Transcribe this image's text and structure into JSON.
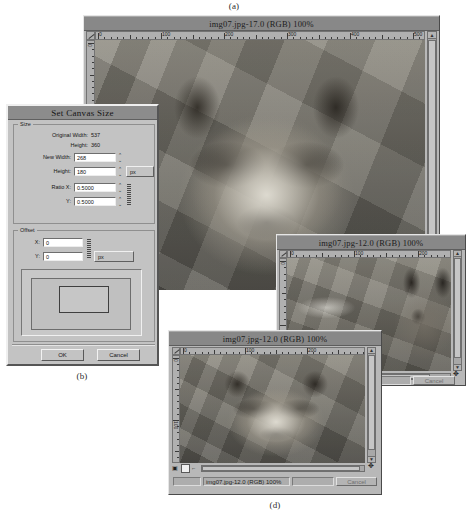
{
  "figure": {
    "captions": [
      {
        "id": "a",
        "label": "(a)"
      },
      {
        "id": "b",
        "label": "(b)"
      },
      {
        "id": "c",
        "label": "(c)"
      },
      {
        "id": "d",
        "label": "(d)"
      }
    ]
  },
  "windows": {
    "main": {
      "title": "img07.jpg-17.0 (RGB) 100%",
      "ruler_h_labels": [
        "0",
        "100",
        "200",
        "300",
        "400",
        "500"
      ],
      "ruler_v_labels": [
        "0"
      ],
      "statusbar_text": "(RGB) 100%"
    },
    "preview_c": {
      "title": "img07.jpg-12.0 (RGB) 100%",
      "ruler_h_labels": [
        "0",
        "100",
        "200"
      ],
      "ruler_v_labels": [
        "0"
      ],
      "statusbar_text": "RGB) 100%",
      "cancel_label": "Cancel"
    },
    "preview_d": {
      "title": "img07.jpg-12.0 (RGB) 100%",
      "ruler_h_labels": [
        "0",
        "100",
        "200"
      ],
      "ruler_v_labels": [
        "0",
        "100"
      ],
      "statusbar_text": "img07.jpg-12.0 (RGB) 100%",
      "cancel_label": "Cancel"
    }
  },
  "dialog": {
    "title": "Set Canvas Size",
    "size_group": {
      "legend": "Size",
      "original_width_label": "Original Width:",
      "original_width_value": "537",
      "original_height_label": "Height:",
      "original_height_value": "360",
      "new_width_label": "New Width:",
      "new_width_value": "268",
      "new_height_label": "Height:",
      "new_height_value": "180",
      "ratio_x_label": "Ratio X:",
      "ratio_x_value": "0.5000",
      "ratio_y_label": "Y:",
      "ratio_y_value": "0.5000",
      "unit": "px"
    },
    "offset_group": {
      "legend": "Offset",
      "x_label": "X:",
      "x_value": "0",
      "y_label": "Y:",
      "y_value": "0",
      "unit": "px"
    },
    "buttons": {
      "ok": "OK",
      "cancel": "Cancel"
    }
  }
}
